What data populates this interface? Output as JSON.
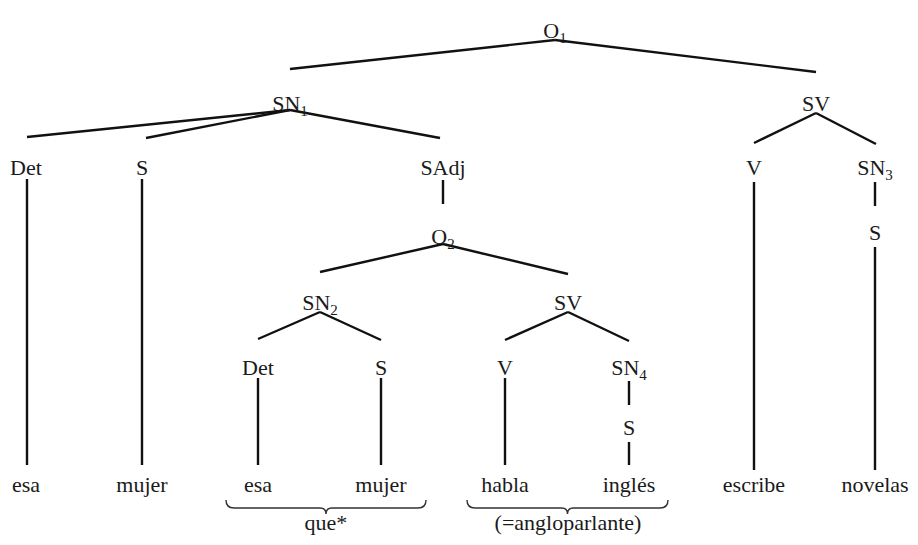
{
  "colors": {
    "ink": "#111111",
    "background": "#ffffff"
  },
  "nodes": {
    "O1": {
      "label": "O",
      "sub": "1",
      "x": 555,
      "y": 30
    },
    "SN1": {
      "label": "SN",
      "sub": "1",
      "x": 290,
      "y": 103
    },
    "SV1": {
      "label": "SV",
      "sub": "",
      "x": 816,
      "y": 103
    },
    "Det1": {
      "label": "Det",
      "sub": "",
      "x": 26,
      "y": 167
    },
    "S1": {
      "label": "S",
      "sub": "",
      "x": 142,
      "y": 167
    },
    "SAdj": {
      "label": "SAdj",
      "sub": "",
      "x": 443,
      "y": 167
    },
    "V1": {
      "label": "V",
      "sub": "",
      "x": 754,
      "y": 167
    },
    "SN3": {
      "label": "SN",
      "sub": "3",
      "x": 875,
      "y": 167
    },
    "S3": {
      "label": "S",
      "sub": "",
      "x": 875,
      "y": 232
    },
    "O2": {
      "label": "O",
      "sub": "2",
      "x": 443,
      "y": 236
    },
    "SN2": {
      "label": "SN",
      "sub": "2",
      "x": 320,
      "y": 302
    },
    "SV2": {
      "label": "SV",
      "sub": "",
      "x": 568,
      "y": 302
    },
    "Det2": {
      "label": "Det",
      "sub": "",
      "x": 258,
      "y": 367
    },
    "S2": {
      "label": "S",
      "sub": "",
      "x": 381,
      "y": 367
    },
    "V2": {
      "label": "V",
      "sub": "",
      "x": 505,
      "y": 367
    },
    "SN4": {
      "label": "SN",
      "sub": "4",
      "x": 629,
      "y": 367
    },
    "S4": {
      "label": "S",
      "sub": "",
      "x": 629,
      "y": 427
    }
  },
  "leaves": [
    {
      "word": "esa",
      "x": 26,
      "y": 492
    },
    {
      "word": "mujer",
      "x": 142,
      "y": 492
    },
    {
      "word": "esa",
      "x": 258,
      "y": 492
    },
    {
      "word": "mujer",
      "x": 381,
      "y": 492
    },
    {
      "word": "habla",
      "x": 505,
      "y": 492
    },
    {
      "word": "inglés",
      "x": 629,
      "y": 492
    },
    {
      "word": "escribe",
      "x": 754,
      "y": 492
    },
    {
      "word": "novelas",
      "x": 875,
      "y": 492
    }
  ],
  "edges": [
    [
      555,
      40,
      290,
      69
    ],
    [
      555,
      40,
      816,
      72
    ],
    [
      290,
      110,
      27,
      137
    ],
    [
      290,
      110,
      146,
      138
    ],
    [
      290,
      110,
      440,
      138
    ],
    [
      816,
      113,
      754,
      143
    ],
    [
      816,
      113,
      876,
      144
    ],
    [
      27,
      179,
      27,
      465
    ],
    [
      142,
      179,
      142,
      465
    ],
    [
      443,
      180,
      443,
      204
    ],
    [
      754,
      182,
      754,
      470
    ],
    [
      875,
      182,
      875,
      206
    ],
    [
      875,
      247,
      875,
      470
    ],
    [
      443,
      244,
      320,
      272
    ],
    [
      443,
      244,
      568,
      274
    ],
    [
      320,
      312,
      258,
      339
    ],
    [
      320,
      312,
      381,
      340
    ],
    [
      568,
      312,
      505,
      340
    ],
    [
      568,
      312,
      629,
      341
    ],
    [
      258,
      378,
      258,
      465
    ],
    [
      381,
      378,
      381,
      465
    ],
    [
      505,
      378,
      505,
      465
    ],
    [
      629,
      381,
      629,
      405
    ],
    [
      629,
      442,
      629,
      465
    ]
  ],
  "braces": [
    {
      "x1": 226,
      "x2": 426,
      "y": 500,
      "label": "que*",
      "label_x": 326,
      "label_y": 530
    },
    {
      "x1": 467,
      "x2": 668,
      "y": 500,
      "label": "(=angloparlante)",
      "label_x": 568,
      "label_y": 530
    }
  ]
}
